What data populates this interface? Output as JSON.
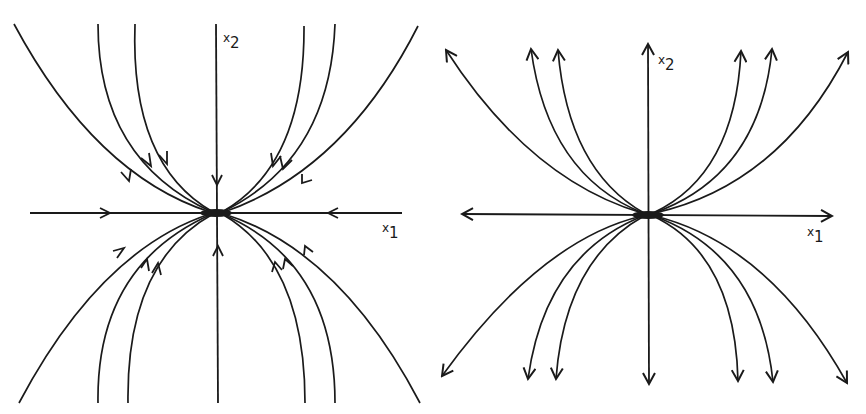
{
  "figure": {
    "colors": {
      "ink": "#1a1a1a",
      "background": "#ffffff"
    },
    "left_panel": {
      "type": "stable-node",
      "x_axis_label": "x",
      "x_axis_sub": "1",
      "y_axis_label": "x",
      "y_axis_sub": "2",
      "arrow_direction": "toward-origin"
    },
    "right_panel": {
      "type": "unstable-node",
      "x_axis_label": "x",
      "x_axis_sub": "1",
      "y_axis_label": "x",
      "y_axis_sub": "2",
      "arrow_direction": "away-from-origin"
    }
  }
}
